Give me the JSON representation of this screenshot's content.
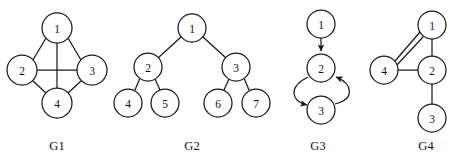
{
  "figure": {
    "width": 459,
    "height": 164,
    "background_color": "#ffffff",
    "stroke_color": "#1a1a1a",
    "node_fill_color": "#ffffff"
  },
  "graphs": [
    {
      "id": "G1",
      "caption": "G1",
      "caption_x": 57,
      "caption_y": 147,
      "kind": "undirected",
      "node_radius": 15,
      "nodes": [
        {
          "label": "1",
          "x": 57,
          "y": 28
        },
        {
          "label": "2",
          "x": 22,
          "y": 70
        },
        {
          "label": "3",
          "x": 92,
          "y": 70
        },
        {
          "label": "4",
          "x": 57,
          "y": 103
        }
      ],
      "edges": [
        {
          "from": "1",
          "to": "2",
          "x1": 46,
          "y1": 38,
          "x2": 33,
          "y2": 60
        },
        {
          "from": "1",
          "to": "3",
          "x1": 68,
          "y1": 38,
          "x2": 81,
          "y2": 60
        },
        {
          "from": "1",
          "to": "4",
          "x1": 57,
          "y1": 43,
          "x2": 57,
          "y2": 88
        },
        {
          "from": "2",
          "to": "3",
          "x1": 37,
          "y1": 70,
          "x2": 77,
          "y2": 70
        },
        {
          "from": "2",
          "to": "4",
          "x1": 33,
          "y1": 81,
          "x2": 46,
          "y2": 93
        },
        {
          "from": "3",
          "to": "4",
          "x1": 81,
          "y1": 81,
          "x2": 68,
          "y2": 93
        }
      ]
    },
    {
      "id": "G2",
      "caption": "G2",
      "caption_x": 192,
      "caption_y": 147,
      "kind": "tree",
      "node_radius": 14,
      "nodes": [
        {
          "label": "1",
          "x": 192,
          "y": 28
        },
        {
          "label": "2",
          "x": 148,
          "y": 67
        },
        {
          "label": "3",
          "x": 236,
          "y": 67
        },
        {
          "label": "4",
          "x": 128,
          "y": 103
        },
        {
          "label": "5",
          "x": 165,
          "y": 103
        },
        {
          "label": "6",
          "x": 218,
          "y": 103
        },
        {
          "label": "7",
          "x": 256,
          "y": 103
        }
      ],
      "edges": [
        {
          "from": "1",
          "to": "2",
          "x1": 181,
          "y1": 37,
          "x2": 158,
          "y2": 58
        },
        {
          "from": "1",
          "to": "3",
          "x1": 203,
          "y1": 37,
          "x2": 226,
          "y2": 58
        },
        {
          "from": "2",
          "to": "4",
          "x1": 140,
          "y1": 78,
          "x2": 135,
          "y2": 90
        },
        {
          "from": "2",
          "to": "5",
          "x1": 155,
          "y1": 79,
          "x2": 160,
          "y2": 90
        },
        {
          "from": "3",
          "to": "6",
          "x1": 229,
          "y1": 79,
          "x2": 224,
          "y2": 90
        },
        {
          "from": "3",
          "to": "7",
          "x1": 244,
          "y1": 78,
          "x2": 249,
          "y2": 90
        }
      ]
    },
    {
      "id": "G3",
      "caption": "G3",
      "caption_x": 318,
      "caption_y": 147,
      "kind": "directed",
      "node_radius": 14,
      "nodes": [
        {
          "label": "1",
          "x": 321,
          "y": 24
        },
        {
          "label": "2",
          "x": 321,
          "y": 68
        },
        {
          "label": "3",
          "x": 321,
          "y": 110
        }
      ],
      "edges": [
        {
          "from": "1",
          "to": "2",
          "type": "straight-arrow",
          "path": "M 321 38 L 321 52"
        },
        {
          "from": "2",
          "to": "3",
          "type": "curved-arrow-left",
          "path": "M 308 77 C 288 86 290 101 309 105"
        },
        {
          "from": "3",
          "to": "2",
          "type": "curved-arrow-right",
          "path": "M 334 105 C 354 100 353 84 334 76"
        }
      ]
    },
    {
      "id": "G4",
      "caption": "G4",
      "caption_x": 426,
      "caption_y": 147,
      "kind": "multigraph",
      "node_radius": 14,
      "nodes": [
        {
          "label": "1",
          "x": 432,
          "y": 25
        },
        {
          "label": "2",
          "x": 432,
          "y": 70
        },
        {
          "label": "3",
          "x": 432,
          "y": 118
        },
        {
          "label": "4",
          "x": 384,
          "y": 70
        }
      ],
      "edges": [
        {
          "from": "1",
          "to": "4",
          "type": "parallel-a",
          "x1": 420,
          "y1": 32,
          "x2": 395,
          "y2": 61
        },
        {
          "from": "1",
          "to": "4",
          "type": "parallel-b",
          "x1": 423,
          "y1": 36,
          "x2": 396,
          "y2": 65
        },
        {
          "from": "1",
          "to": "2",
          "x1": 432,
          "y1": 39,
          "x2": 432,
          "y2": 56
        },
        {
          "from": "4",
          "to": "2",
          "x1": 398,
          "y1": 70,
          "x2": 418,
          "y2": 70
        },
        {
          "from": "2",
          "to": "3",
          "x1": 432,
          "y1": 84,
          "x2": 432,
          "y2": 104
        }
      ]
    }
  ]
}
